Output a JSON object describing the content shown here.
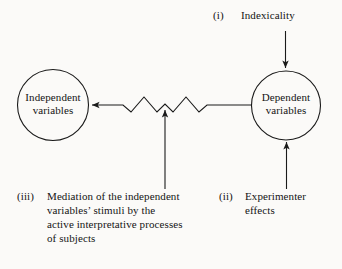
{
  "figure": {
    "background_color": "#fbfaf8",
    "stroke_color": "#1a1a1a"
  },
  "nodes": [
    {
      "id": "independent-variables",
      "lines": [
        "Independent",
        "variables"
      ],
      "shape": "circle"
    },
    {
      "id": "dependent-variables",
      "lines": [
        "Dependent",
        "variables"
      ],
      "shape": "circle"
    }
  ],
  "annotations": [
    {
      "id": "indexicality",
      "marker": "(i)",
      "lines": [
        "Indexicality"
      ]
    },
    {
      "id": "mediation",
      "marker": "(iii)",
      "lines": [
        "Mediation of the independent",
        "variables’ stimuli by the",
        "active interpretative processes",
        "of subjects"
      ]
    },
    {
      "id": "experimenter-effects",
      "marker": "(ii)",
      "lines": [
        "Experimenter",
        "effects"
      ]
    }
  ],
  "connectors": [
    {
      "id": "dependent-to-independent",
      "from": "dependent-variables",
      "to": "independent-variables",
      "style": "zigzag-interrupted",
      "arrowhead": "left"
    },
    {
      "id": "indexicality-to-dependent",
      "from": "indexicality",
      "to": "dependent-variables",
      "style": "straight",
      "arrowhead": "down"
    },
    {
      "id": "experimenter-to-dependent",
      "from": "experimenter-effects",
      "to": "dependent-variables",
      "style": "straight",
      "arrowhead": "up"
    },
    {
      "id": "mediation-to-zigzag",
      "from": "mediation",
      "to": "dependent-to-independent",
      "style": "straight",
      "arrowhead": "up"
    }
  ]
}
